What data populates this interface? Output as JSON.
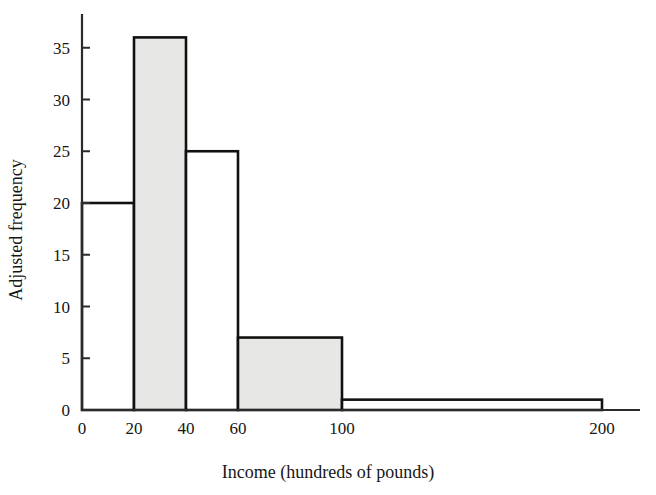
{
  "chart_data": {
    "type": "bar",
    "title": "",
    "subtitle": "",
    "xlabel": "Income (hundreds of pounds)",
    "ylabel": "Adjusted frequency",
    "grid": false,
    "legend": "none",
    "xlim": [
      0,
      230
    ],
    "ylim": [
      0,
      37
    ],
    "xticks": [
      0,
      20,
      40,
      60,
      100,
      200
    ],
    "xtick_labels": [
      "0",
      "20",
      "40",
      "60",
      "100",
      "200"
    ],
    "yticks": [
      0,
      5,
      10,
      15,
      20,
      25,
      30,
      35
    ],
    "ytick_labels": [
      "0",
      "5",
      "10",
      "15",
      "20",
      "25",
      "30",
      "35"
    ],
    "bin_edges": [
      0,
      20,
      40,
      60,
      100,
      200
    ],
    "categories": [
      "0-20",
      "20-40",
      "40-60",
      "60-100",
      "100-200"
    ],
    "values": [
      20,
      36,
      25,
      7,
      1
    ],
    "bar_fills": [
      "#ffffff",
      "#e7e7e5",
      "#ffffff",
      "#e7e7e5",
      "#ffffff"
    ],
    "bar_edge_color": "#111111",
    "axis_color": "#2b2b2b"
  },
  "figure": {
    "background": "#ffffff",
    "axis_extends_past_last_bar": true
  }
}
